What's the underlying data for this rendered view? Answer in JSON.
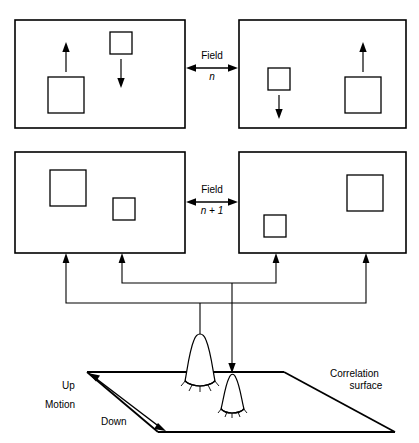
{
  "figure": {
    "type": "diagram",
    "background": "#ffffff",
    "stroke": "#000000",
    "stroke_thin": "#222222"
  },
  "panels": [
    {
      "id": "field-n-left",
      "row": 1,
      "column": "left",
      "x": 15,
      "y": 20,
      "width": 170,
      "height": 108,
      "objects": [
        {
          "name": "large-square",
          "x": 48,
          "y": 77,
          "size": 36,
          "motion": "up"
        },
        {
          "name": "small-square",
          "x": 110,
          "y": 32,
          "size": 22,
          "motion": "down"
        }
      ]
    },
    {
      "id": "field-n-right",
      "row": 1,
      "column": "right",
      "x": 239,
      "y": 20,
      "width": 167,
      "height": 108,
      "objects": [
        {
          "name": "small-square",
          "x": 268,
          "y": 68,
          "size": 22,
          "motion": "down"
        },
        {
          "name": "large-square",
          "x": 345,
          "y": 77,
          "size": 36,
          "motion": "up"
        }
      ]
    },
    {
      "id": "field-n1-left",
      "row": 2,
      "column": "left",
      "x": 15,
      "y": 152,
      "width": 170,
      "height": 101,
      "objects": [
        {
          "name": "large-square",
          "x": 50,
          "y": 170,
          "size": 36,
          "motion": "none"
        },
        {
          "name": "small-square",
          "x": 113,
          "y": 198,
          "size": 22,
          "motion": "none"
        }
      ]
    },
    {
      "id": "field-n1-right",
      "row": 2,
      "column": "right",
      "x": 239,
      "y": 152,
      "width": 167,
      "height": 101,
      "objects": [
        {
          "name": "large-square",
          "x": 347,
          "y": 175,
          "size": 36,
          "motion": "none"
        },
        {
          "name": "small-square",
          "x": 264,
          "y": 215,
          "size": 22,
          "motion": "none"
        }
      ]
    }
  ],
  "field_labels": [
    {
      "id": "field-n",
      "line1": "Field",
      "line2": "n",
      "x": 212,
      "y": 56
    },
    {
      "id": "field-n1",
      "line1": "Field",
      "line2": "n + 1",
      "x": 212,
      "y": 190
    }
  ],
  "surface": {
    "label_line1": "Correlation",
    "label_line2": "surface",
    "label_x": 415,
    "label_y": 374,
    "corners": {
      "left": [
        87,
        372
      ],
      "top": [
        232,
        372
      ],
      "right": [
        395,
        432
      ],
      "bottom": [
        158,
        432
      ]
    },
    "peaks": [
      {
        "name": "peak-up-large",
        "x": 200,
        "base_y": 372,
        "height": 42,
        "width": 30
      },
      {
        "name": "peak-down-small",
        "x": 232,
        "base_y": 402,
        "height": 26,
        "width": 22
      }
    ]
  },
  "motion_axis": {
    "up_label": "Up",
    "down_label": "Down",
    "axis_label": "Motion",
    "up_x": 70,
    "up_y": 385,
    "motion_x": 55,
    "motion_y": 403,
    "down_x": 108,
    "down_y": 420
  },
  "bus": {
    "arrow_xs": [
      66,
      122,
      276,
      366
    ],
    "arrow_tip_y": 254,
    "inner_bus_y": 283,
    "outer_bus_y": 303,
    "drop_xs": [
      200,
      232
    ],
    "drop_tip_ys": [
      352,
      372
    ]
  },
  "caption": {
    "text": ""
  }
}
